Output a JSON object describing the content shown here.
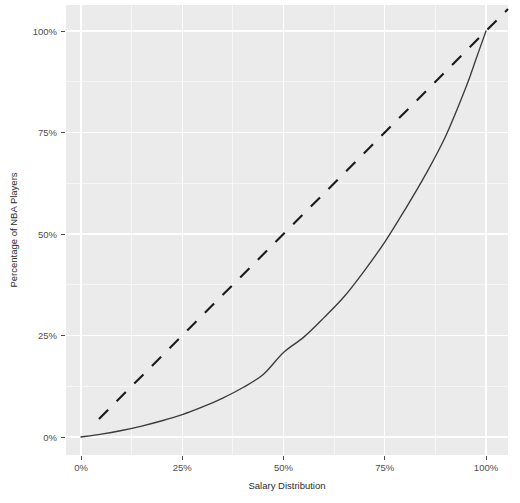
{
  "chart_data": {
    "type": "line",
    "title": "",
    "subtitle": "",
    "xlabel": "Salary Distribution",
    "ylabel": "Percentage of NBA Players",
    "xlim": [
      0,
      100
    ],
    "ylim": [
      0,
      100
    ],
    "grid": true,
    "legend": "none",
    "x_tick_labels": [
      "0%",
      "25%",
      "50%",
      "75%",
      "100%"
    ],
    "x_tick_values": [
      0,
      25,
      50,
      75,
      100
    ],
    "y_tick_labels": [
      "0%",
      "25%",
      "50%",
      "75%",
      "100%"
    ],
    "y_tick_values": [
      0,
      25,
      50,
      75,
      100
    ],
    "minor_gridlines": [
      12.5,
      37.5,
      62.5,
      87.5
    ],
    "series": [
      {
        "name": "Lorenz curve",
        "style": "solid",
        "color": "#3b3b3b",
        "x": [
          0,
          5,
          10,
          15,
          20,
          25,
          30,
          35,
          40,
          45,
          50,
          55,
          60,
          65,
          70,
          75,
          80,
          85,
          90,
          95,
          97.5,
          100
        ],
        "values": [
          0,
          0.7,
          1.6,
          2.7,
          4.0,
          5.5,
          7.4,
          9.6,
          12.2,
          15.4,
          20.8,
          24.6,
          29.4,
          34.6,
          41.0,
          48.0,
          56.0,
          64.5,
          74.0,
          86.0,
          93.0,
          100
        ]
      },
      {
        "name": "Line of equality",
        "style": "dashed",
        "color": "#1a1a1a",
        "x": [
          0,
          100
        ],
        "values": [
          0,
          100
        ]
      }
    ]
  },
  "axis": {
    "x_title": "Salary Distribution",
    "y_title": "Percentage of NBA Players"
  },
  "ticks": {
    "x": [
      "0%",
      "25%",
      "50%",
      "75%",
      "100%"
    ],
    "y": [
      "0%",
      "25%",
      "50%",
      "75%",
      "100%"
    ]
  },
  "colors": {
    "panel_background": "#ebebeb",
    "gridline": "#ffffff",
    "curve": "#3b3b3b",
    "reference": "#1a1a1a",
    "axis_text": "#4d4d4d"
  }
}
